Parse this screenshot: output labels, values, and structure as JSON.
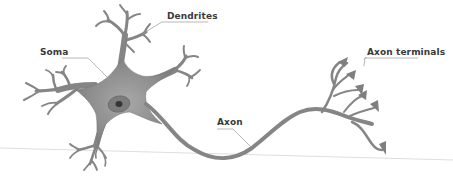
{
  "diagram": {
    "colors": {
      "cell_fill": "#8a8a8a",
      "cell_dark": "#6f6f6f",
      "soma_light": "#a6a6a6",
      "nucleus": "#7a7a7a",
      "nucleolus": "#3a3a3a",
      "label_text": "#3a3a3a",
      "leader_line": "#9a9a9a",
      "ground_line": "#dcdcdc"
    },
    "labels": [
      {
        "id": "dendrites",
        "text": "Dendrites",
        "x": 167,
        "y": 11
      },
      {
        "id": "soma",
        "text": "Soma",
        "x": 40,
        "y": 47
      },
      {
        "id": "axon",
        "text": "Axon",
        "x": 217,
        "y": 117
      },
      {
        "id": "axon-terminals",
        "text": "Axon terminals",
        "x": 367,
        "y": 47
      }
    ]
  }
}
